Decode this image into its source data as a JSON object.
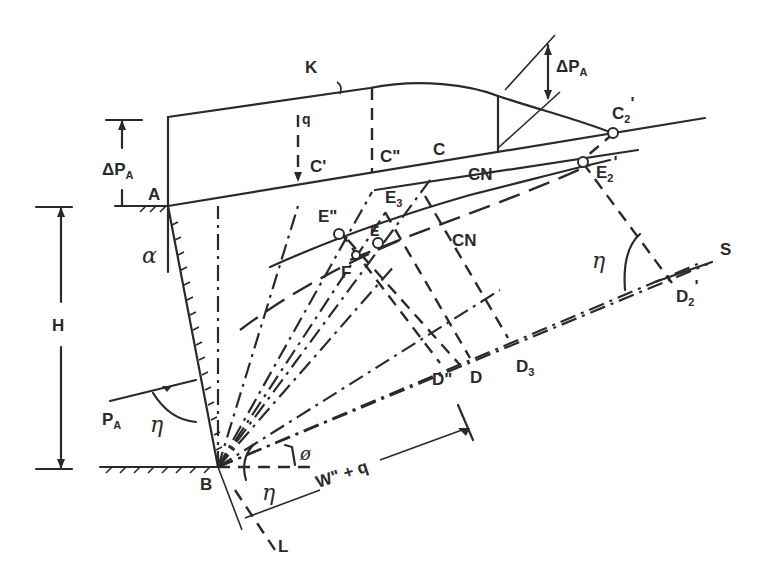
{
  "diagram": {
    "labels": {
      "K": "K",
      "q": "q",
      "C_prime": "C'",
      "C_double": "C\"",
      "C": "C",
      "CN_top": "CN",
      "CN_mid": "CN",
      "C2": "C",
      "C2_sub": "2",
      "C2_mark": "'",
      "E2": "E",
      "E2_sub": "2",
      "E2_mark": "'",
      "dPA_left": "ΔP",
      "dPA_left_sub": "A",
      "dPA_right": "ΔP",
      "dPA_right_sub": "A",
      "A": "A",
      "B": "B",
      "E_double": "E\"",
      "E": "E",
      "E3": "E",
      "E3_sub": "3",
      "F": "F",
      "alpha": "α",
      "H": "H",
      "eta_right": "η",
      "eta_left": "η",
      "eta_bottom": "η",
      "S": "S",
      "D2": "D",
      "D2_sub": "2",
      "D2_mark": "'",
      "D_double": "D\"",
      "D": "D",
      "D3": "D",
      "D3_sub": "3",
      "PA": "P",
      "PA_sub": "A",
      "phi": "ø",
      "W_q": "W\" + q",
      "L": "L"
    }
  }
}
